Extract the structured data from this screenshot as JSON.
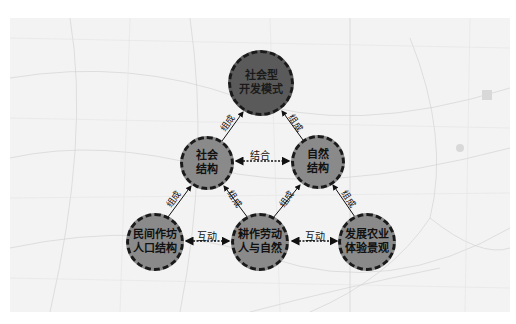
{
  "nodes": {
    "top": {
      "label": "社会型\n开发模式"
    },
    "social_structure": {
      "label": "社会\n结构"
    },
    "natural_structure": {
      "label": "自然\n结构"
    },
    "folk_workshop": {
      "label": "民间作坊\n人口结构"
    },
    "farming": {
      "label": "耕作劳动\n人与自然"
    },
    "agri_landscape": {
      "label": "发展农业\n体验景观"
    }
  },
  "edges": {
    "combine": "结合",
    "interact_left": "互动",
    "interact_right": "互动",
    "compose": "组成"
  },
  "colors": {
    "top_fill": "#5a5a5a",
    "node_fill": "#8a8a8a",
    "border": "#1a1a1a",
    "map_bg": "#f3f3f3"
  }
}
